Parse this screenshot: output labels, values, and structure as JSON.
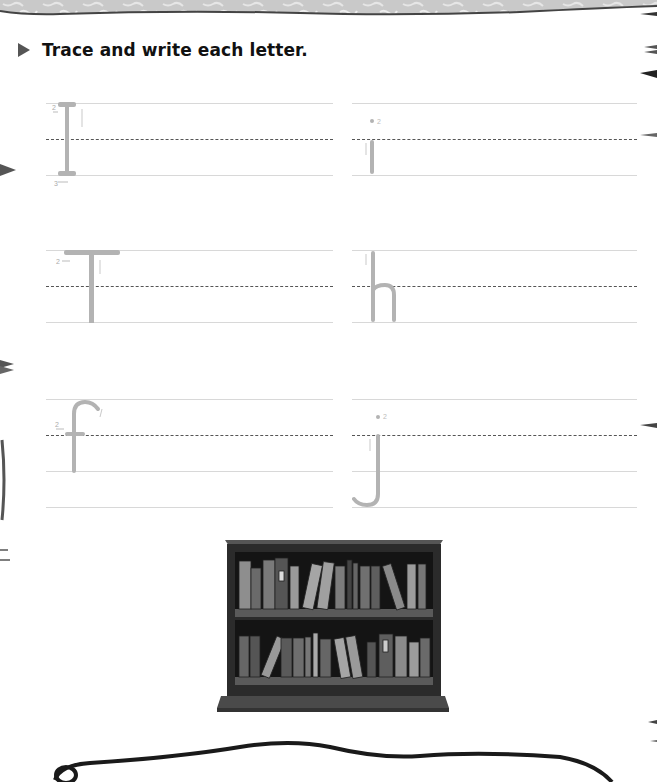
{
  "instruction": {
    "icon": "triangle-right-icon",
    "text": "Trace and write each letter."
  },
  "practice_rows": [
    {
      "letter": "I",
      "strokes": [
        "1",
        "2",
        "3"
      ],
      "column": "left"
    },
    {
      "letter": "i",
      "strokes": [
        "1",
        "2"
      ],
      "column": "right"
    },
    {
      "letter": "T",
      "strokes": [
        "1",
        "2"
      ],
      "column": "left"
    },
    {
      "letter": "h",
      "strokes": [
        "1"
      ],
      "column": "right"
    },
    {
      "letter": "f",
      "strokes": [
        "1",
        "2"
      ],
      "column": "left"
    },
    {
      "letter": "j",
      "strokes": [
        "1",
        "2"
      ],
      "column": "right"
    }
  ],
  "illustration": {
    "subject": "bookcase-with-books"
  },
  "colors": {
    "trace_letter": "#b3b3b3",
    "guide_line": "#d8d8d8",
    "dashed_midline": "#555555",
    "text": "#111111"
  }
}
